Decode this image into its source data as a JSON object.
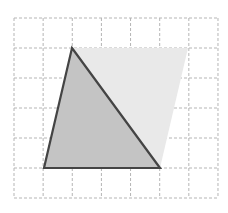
{
  "figure": {
    "canvas": {
      "width": 228,
      "height": 213,
      "background": "#ffffff"
    },
    "grid": {
      "name": "dashed-grid",
      "x_start": 14,
      "y_start": 18,
      "x_end": 218,
      "y_end": 198,
      "cell_width": 29.14,
      "cell_height": 30,
      "columns": 7,
      "rows": 6,
      "line_color": "#b5b5b5",
      "line_width": 1,
      "dash_pattern": "3 2",
      "visible": true
    },
    "shapes": [
      {
        "name": "parallelogram",
        "kind": "parallelogram",
        "vertices": [
          [
            72,
            48
          ],
          [
            188,
            48
          ],
          [
            160,
            168
          ],
          [
            44,
            168
          ]
        ],
        "fill_color": "#e9e9e9",
        "stroke_color": "none",
        "stroke_width": 0,
        "label": "Parallelogram"
      },
      {
        "name": "triangle",
        "kind": "triangle",
        "vertices": [
          [
            72,
            48
          ],
          [
            160,
            168
          ],
          [
            44,
            168
          ]
        ],
        "fill_color": "#c9c9c9",
        "fill_opacity": 0.95,
        "stroke_color": "#444444",
        "stroke_width": 2.2,
        "label": "Triangle"
      }
    ],
    "overlap_region": {
      "name": "triangle-parallelogram-overlap",
      "fill_color": "#c2c2c2",
      "description": "Region where triangle and parallelogram coincide"
    }
  },
  "chart_data": {
    "type": "scatter",
    "xlabel": "",
    "ylabel": "",
    "xlim": [
      14,
      218
    ],
    "ylim": [
      18,
      198
    ],
    "grid": true,
    "legend": "none",
    "series": [
      {
        "name": "parallelogram",
        "x": [
          72,
          188,
          160,
          44
        ],
        "y": [
          48,
          48,
          168,
          168
        ]
      },
      {
        "name": "triangle",
        "x": [
          72,
          160,
          44
        ],
        "y": [
          48,
          168,
          168
        ]
      }
    ]
  }
}
